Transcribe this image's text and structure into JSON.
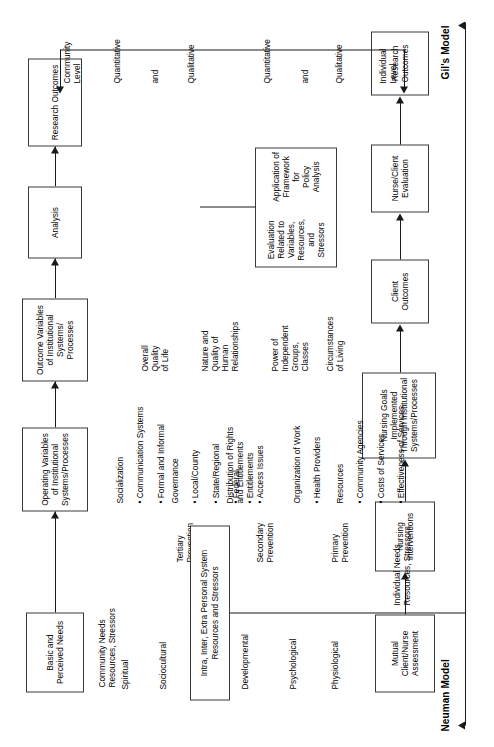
{
  "figure": {
    "type": "comparative-flow-diagram",
    "models": [
      "Neuman Model",
      "Gil's Model"
    ]
  },
  "labels": {
    "neuman_model": "Neuman Model",
    "gils_model": "Gil's Model"
  },
  "neuman": {
    "flow_boxes": [
      "Mutual Client/Nurse\nAssessment",
      "Nursing\nInterventions",
      "Nursing Goals\nImplemented Through\nInstitutional\nSystems/Processes",
      "Client\nOutcomes",
      "Nurse/Client\nEvaluation",
      "Research\nOutcomes"
    ],
    "assessment_label": "Individual Needs\nResources, Stressors",
    "variables": [
      "Physiological",
      "Psychological",
      "Developmental",
      "Sociocultural",
      "Spiritual"
    ],
    "prevention_levels": [
      "Primary\nPrevention",
      "Secondary\nPrevention",
      "Tertiary\nPrevention"
    ],
    "stressor_box": "Intra, Inter, Extra Personal\nSystem Resources and Stressors",
    "evaluation_box": [
      "Evaluation\nRelated to\nVariables,\nResources,\nand Stressors",
      "Application of\nFramework for\nPolicy Analysis"
    ],
    "outcome_level": "Individual\nLevel",
    "outcome_methods": [
      "Qualitative",
      "and",
      "Quantitative"
    ]
  },
  "gil": {
    "flow_boxes": [
      "Basic and\nPerceived Needs",
      "Operating Variables\nof Institutional\nSystems/Processes",
      "Outcome\nVariables of\nInstitutional\nSystems/\nProcesses",
      "Analysis",
      "Research\nOutcomes"
    ],
    "needs_label": "Community Needs\nResources, Stressors",
    "operating_groups": [
      {
        "heading": "Resources",
        "items": [
          "Community Agencies",
          "Costs of Services",
          "Effectiveness of Services"
        ]
      },
      {
        "heading": "Organization of Work",
        "items": [
          "Health Providers"
        ]
      },
      {
        "heading": "Distribution of Rights\nand Entitlements",
        "items": [
          "Entitlements",
          "Access Issues"
        ]
      },
      {
        "heading": "Governance",
        "items": [
          "Local/County",
          "State/Regional",
          "Federal"
        ]
      },
      {
        "heading": "Socialization",
        "items": [
          "Communication Systems",
          "Formal and Informal"
        ]
      }
    ],
    "outcome_variables": [
      "Circumstances\nof Living",
      "Power of\nIndependent\nGroups,\nClasses",
      "Nature and\nQuality of\nHuman\nRelationships",
      "Overall\nQuality\nof Life"
    ],
    "outcome_level": "Community\nLevel",
    "outcome_methods": [
      "Qualitative",
      "and",
      "Quantitative"
    ]
  }
}
